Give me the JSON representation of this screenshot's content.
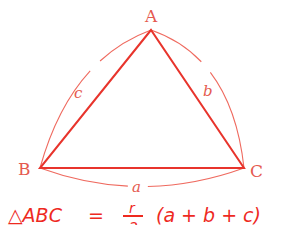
{
  "diagram": {
    "type": "triangle-perimeter",
    "colors": {
      "triangle": "#e8342c",
      "arc": "#ef6a5f",
      "label": "#e55a50",
      "handwriting": "#ee2a1f"
    },
    "vertices": [
      {
        "id": "A",
        "label": "A",
        "x": 151,
        "y": 30
      },
      {
        "id": "B",
        "label": "B",
        "x": 40,
        "y": 168
      },
      {
        "id": "C",
        "label": "C",
        "x": 244,
        "y": 168
      }
    ],
    "sides": [
      {
        "id": "a",
        "label": "a",
        "between": [
          "B",
          "C"
        ]
      },
      {
        "id": "b",
        "label": "b",
        "between": [
          "A",
          "C"
        ]
      },
      {
        "id": "c",
        "label": "c",
        "between": [
          "A",
          "B"
        ]
      }
    ],
    "formula": {
      "handwritten": "△ABC = r/2 (a + b + c)",
      "lhs": "△ABC",
      "equals": "=",
      "fraction_numerator": "r",
      "fraction_denominator": "2",
      "rhs": "(a + b + c)"
    }
  }
}
